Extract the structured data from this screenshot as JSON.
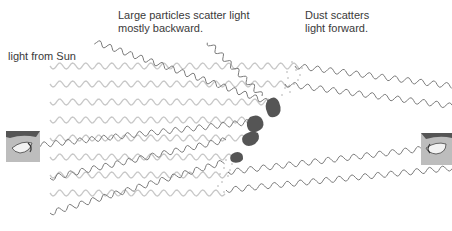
{
  "diagram": {
    "labels": {
      "sun_light": "light from Sun",
      "large_particles_line1": "Large particles scatter light",
      "large_particles_line2": "mostly backward.",
      "dust_line1": "Dust scatters",
      "dust_line2": "light forward."
    },
    "colors": {
      "incident_wave": "#c8c8c8",
      "scattered_wave": "#7a7a7a",
      "particle": "#555555",
      "dust": "#9a9a9a",
      "eye_panel": "#bdbdbd",
      "text": "#3a3a3a"
    },
    "elements": {
      "incident_rows": 8,
      "large_particles": 4,
      "observers": [
        "observer-left-backward",
        "observer-right-forward"
      ]
    }
  }
}
